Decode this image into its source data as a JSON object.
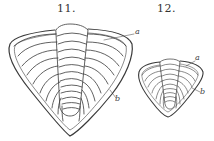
{
  "figures": [
    {
      "number": "11.",
      "labels": {
        "a": "a",
        "b": "b"
      }
    },
    {
      "number": "12.",
      "labels": {
        "a": "a",
        "b": "b"
      }
    }
  ],
  "colors": {
    "ink": "#3a3a3a",
    "paper": "#ffffff"
  }
}
